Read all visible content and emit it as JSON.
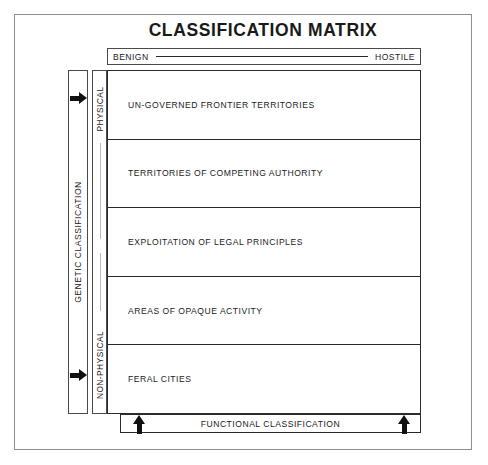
{
  "title": "CLASSIFICATION MATRIX",
  "header": {
    "left_label": "BENIGN",
    "right_label": "HOSTILE"
  },
  "vertical_axis": {
    "outer_label": "GENETIC CLASSIFICATION",
    "segments": [
      {
        "label": "PHYSICAL"
      },
      {
        "label": "NON-PHYSICAL"
      }
    ]
  },
  "matrix": {
    "rows": [
      {
        "label": "UN-GOVERNED FRONTIER TERRITORIES"
      },
      {
        "label": "TERRITORIES OF COMPETING AUTHORITY"
      },
      {
        "label": "EXPLOITATION OF LEGAL PRINCIPLES"
      },
      {
        "label": "AREAS OF OPAQUE ACTIVITY"
      },
      {
        "label": "FERAL CITIES"
      }
    ]
  },
  "footer": {
    "label": "FUNCTIONAL CLASSIFICATION"
  },
  "icons": {
    "axis_marker_top": "arrow-right-icon",
    "axis_marker_bottom": "arrow-right-icon",
    "footer_marker_left": "arrow-up-icon",
    "footer_marker_right": "arrow-up-icon"
  },
  "colors": {
    "page_background": "#ffffff",
    "frame_border": "#8e9093",
    "line": "#2b2b2b",
    "text": "#1a1a1a",
    "arrow": "#111111",
    "faint_line": "#b9bcbf"
  }
}
